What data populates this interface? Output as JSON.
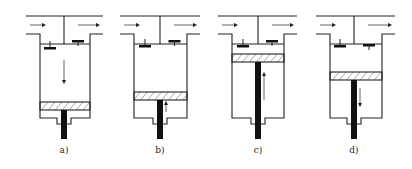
{
  "diagram": {
    "type": "four-stroke engine cycle",
    "panels": [
      {
        "label": "a)",
        "cx": 64,
        "left": 40,
        "right": 90,
        "piston_top": 102,
        "piston_motion": "down",
        "arrow_y1": 60,
        "arrow_y2": 82,
        "intake_valve": "open",
        "exhaust_valve": "closed"
      },
      {
        "label": "b)",
        "cx": 160,
        "left": 134,
        "right": 187,
        "piston_top": 92,
        "piston_motion": "up",
        "arrow_y1": 112,
        "arrow_y2": 103,
        "intake_valve": "closed",
        "exhaust_valve": "closed"
      },
      {
        "label": "c)",
        "cx": 258,
        "left": 232,
        "right": 284,
        "piston_top": 54,
        "piston_motion": "up",
        "arrow_y1": 100,
        "arrow_y2": 74,
        "intake_valve": "closed",
        "exhaust_valve": "closed"
      },
      {
        "label": "d)",
        "cx": 354,
        "left": 330,
        "right": 382,
        "piston_top": 72,
        "piston_motion": "down",
        "arrow_y1": 88,
        "arrow_y2": 105,
        "intake_valve": "closed",
        "exhaust_valve": "open"
      }
    ]
  },
  "colors": {
    "line": "#222222",
    "fill": "#111111",
    "background": "#ffffff"
  }
}
